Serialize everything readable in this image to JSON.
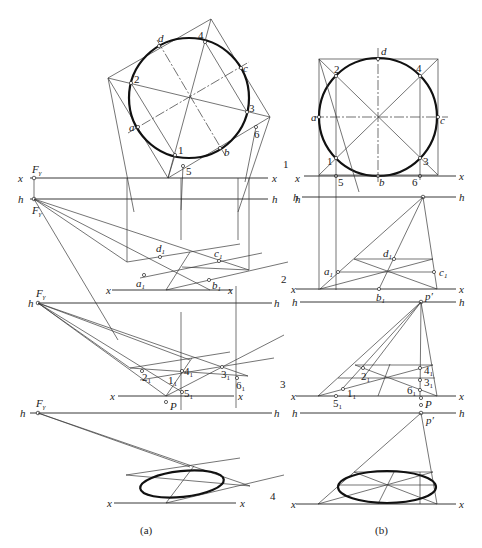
{
  "figure": {
    "panel_a": {
      "caption": "(a)",
      "step_numbers": [
        "1",
        "2",
        "3",
        "4"
      ],
      "top_view": {
        "axis_labels": {
          "x": "x",
          "h": "h"
        },
        "point_labels": [
          "1",
          "2",
          "3",
          "4",
          "5",
          "6",
          "a",
          "b",
          "c",
          "d"
        ],
        "vanishing_label": "F",
        "vanishing_sub": "γ"
      },
      "step2": {
        "point_labels": {
          "a1": "a",
          "b1": "b",
          "c1": "c",
          "d1": "d",
          "sub": "1"
        }
      },
      "step3": {
        "point_labels": {
          "p1": "1",
          "p2": "2",
          "p3": "3",
          "p4": "4",
          "p5": "5",
          "p6": "6",
          "sub": "1"
        },
        "station_point": "P"
      }
    },
    "panel_b": {
      "caption": "(b)",
      "top_view": {
        "point_labels": [
          "1",
          "2",
          "3",
          "4",
          "5",
          "6",
          "a",
          "b",
          "c",
          "d"
        ]
      },
      "step2": {
        "point_labels": {
          "a1": "a",
          "b1": "b",
          "c1": "c",
          "d1": "d",
          "sub": "1"
        },
        "principal_point": "p′"
      },
      "step3": {
        "point_labels": {
          "p1": "1",
          "p2": "2",
          "p3": "3",
          "p4": "4",
          "p5": "5",
          "p6": "6",
          "sub": "1"
        },
        "principal_point": "p′",
        "station_point": "P"
      },
      "step4": {
        "principal_point": "p′"
      }
    },
    "axis": {
      "x": "x",
      "h": "h"
    }
  }
}
